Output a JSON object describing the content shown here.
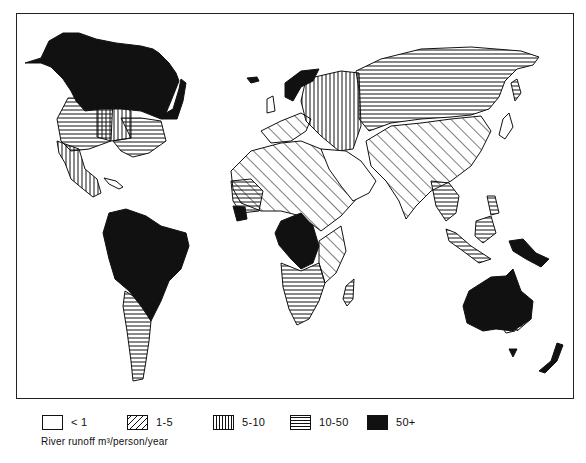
{
  "map": {
    "title": "World river runoff per person",
    "regions": [
      {
        "name": "Canada & Alaska",
        "class": "50+"
      },
      {
        "name": "Western USA",
        "class": "10-50"
      },
      {
        "name": "Central USA",
        "class": "5-10"
      },
      {
        "name": "Eastern USA",
        "class": "10-50"
      },
      {
        "name": "Mexico",
        "class": "5-10"
      },
      {
        "name": "South America (north)",
        "class": "50+"
      },
      {
        "name": "South America (south)",
        "class": "10-50"
      },
      {
        "name": "Scandinavia",
        "class": "50+"
      },
      {
        "name": "Western Europe",
        "class": "1-5"
      },
      {
        "name": "Eastern Europe",
        "class": "5-10"
      },
      {
        "name": "Russia / Siberia",
        "class": "10-50"
      },
      {
        "name": "North Africa",
        "class": "1-5"
      },
      {
        "name": "Arabian Peninsula",
        "class": "<1"
      },
      {
        "name": "Central Africa",
        "class": "50+"
      },
      {
        "name": "Southern Africa",
        "class": "10-50"
      },
      {
        "name": "Madagascar",
        "class": "10-50"
      },
      {
        "name": "South Asia / China",
        "class": "1-5"
      },
      {
        "name": "Southeast Asia",
        "class": "10-50"
      },
      {
        "name": "New Guinea",
        "class": "50+"
      },
      {
        "name": "Australia",
        "class": "50+"
      },
      {
        "name": "SE Australia",
        "class": "1-5"
      },
      {
        "name": "New Zealand",
        "class": "50+"
      }
    ]
  },
  "legend": {
    "items": [
      {
        "label": "< 1",
        "pattern": "empty"
      },
      {
        "label": "1-5",
        "pattern": "diagonal"
      },
      {
        "label": "5-10",
        "pattern": "vertical"
      },
      {
        "label": "10-50",
        "pattern": "horizontal"
      },
      {
        "label": "50+",
        "pattern": "solid"
      }
    ],
    "caption": "River runoff m³/person/year"
  }
}
